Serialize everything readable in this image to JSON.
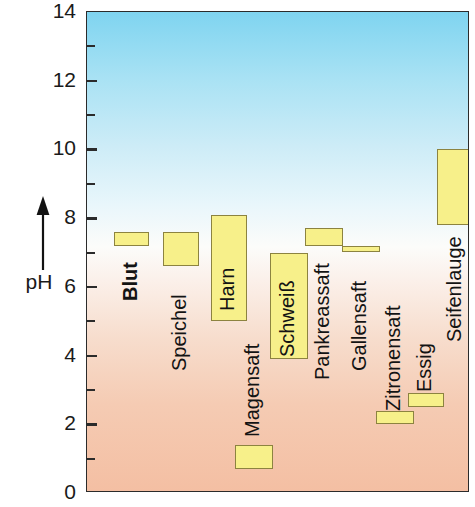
{
  "chart_data": {
    "type": "bar",
    "orientation": "vertical-range",
    "title": "",
    "subtitle": "",
    "xlabel": "",
    "ylabel": "pH",
    "ylim": [
      0,
      14
    ],
    "ytick_step": 2,
    "yticks": [
      0,
      2,
      4,
      6,
      8,
      10,
      12,
      14
    ],
    "ytick_labels": [
      "0",
      "2",
      "4",
      "6",
      "8",
      "10",
      "12",
      "14"
    ],
    "minor_ticks": [
      1,
      3,
      5,
      7,
      9,
      11,
      13
    ],
    "grid": false,
    "legend": null,
    "background_gradient": {
      "top_color": "#7fd4f0",
      "middle_color": "#fcfcfa",
      "bottom_color": "#f4bfa3",
      "top_meaning": "alkalisch",
      "bottom_meaning": "sauer"
    },
    "bar_fill_color": "#f7f08a",
    "bar_border_color": "#8c8340",
    "categories": [
      "Blut",
      "Speichel",
      "Harn",
      "Magensaft",
      "Schweiß",
      "Pankreassaft",
      "Gallensaft",
      "Zitronensaft",
      "Essig",
      "Seifenlauge"
    ],
    "series": [
      {
        "name": "pH-Bereich",
        "ranges": [
          {
            "label": "Blut",
            "low": 7.2,
            "high": 7.6
          },
          {
            "label": "Speichel",
            "low": 6.6,
            "high": 7.6
          },
          {
            "label": "Harn",
            "low": 5.0,
            "high": 8.1
          },
          {
            "label": "Magensaft",
            "low": 0.7,
            "high": 1.4
          },
          {
            "label": "Schweiß",
            "low": 3.9,
            "high": 7.0
          },
          {
            "label": "Pankreassaft",
            "low": 7.2,
            "high": 7.7
          },
          {
            "label": "Gallensaft",
            "low": 7.0,
            "high": 7.2
          },
          {
            "label": "Zitronensaft",
            "low": 2.0,
            "high": 2.4
          },
          {
            "label": "Essig",
            "low": 2.5,
            "high": 2.9
          },
          {
            "label": "Seifenlauge",
            "low": 7.8,
            "high": 10.0
          }
        ]
      }
    ]
  },
  "bars": [
    {
      "label": "Blut",
      "low": 7.2,
      "high": 7.6,
      "x": 27,
      "width": 35,
      "bold": true,
      "label_x": 33,
      "label_y": 289
    },
    {
      "label": "Speichel",
      "low": 6.6,
      "high": 7.6,
      "x": 76,
      "width": 36,
      "bold": false,
      "label_x": 82,
      "label_y": 359
    },
    {
      "label": "Harn",
      "low": 5.0,
      "high": 8.1,
      "x": 124,
      "width": 36,
      "bold": false,
      "label_x": 130,
      "label_y": 299
    },
    {
      "label": "Magensaft",
      "low": 0.7,
      "high": 1.4,
      "x": 148,
      "width": 38,
      "bold": false,
      "label_x": 155,
      "label_y": 425
    },
    {
      "label": "Schweiß",
      "low": 3.9,
      "high": 7.0,
      "x": 183,
      "width": 38,
      "bold": false,
      "label_x": 190,
      "label_y": 345
    },
    {
      "label": "Pankreassaft",
      "low": 7.2,
      "high": 7.7,
      "x": 218,
      "width": 38,
      "bold": false,
      "label_x": 225,
      "label_y": 368
    },
    {
      "label": "Gallensaft",
      "low": 7.0,
      "high": 7.2,
      "x": 255,
      "width": 38,
      "bold": false,
      "label_x": 262,
      "label_y": 359
    },
    {
      "label": "Zitronensaft",
      "low": 2.0,
      "high": 2.4,
      "x": 289,
      "width": 38,
      "bold": false,
      "label_x": 296,
      "label_y": 399
    },
    {
      "label": "Essig",
      "low": 2.5,
      "high": 2.9,
      "x": 321,
      "width": 36,
      "bold": false,
      "label_x": 327,
      "label_y": 380
    },
    {
      "label": "Seifenlauge",
      "low": 7.8,
      "high": 10.0,
      "x": 350,
      "width": 36,
      "bold": false,
      "label_x": 357,
      "label_y": 330
    }
  ],
  "axis": {
    "label": "pH",
    "arrow_icon": "up-arrow-icon",
    "ticks": [
      {
        "value": 14,
        "label": "14"
      },
      {
        "value": 12,
        "label": "12"
      },
      {
        "value": 10,
        "label": "10"
      },
      {
        "value": 8,
        "label": "8"
      },
      {
        "value": 6,
        "label": "6"
      },
      {
        "value": 4,
        "label": "4"
      },
      {
        "value": 2,
        "label": "2"
      },
      {
        "value": 0,
        "label": "0"
      }
    ],
    "minor_tick_values": [
      13,
      11,
      9,
      7,
      5,
      3,
      1
    ]
  }
}
